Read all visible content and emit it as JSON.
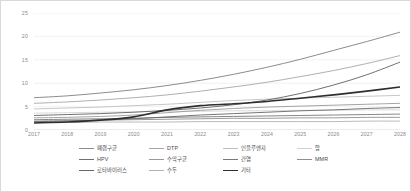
{
  "chart_data": {
    "type": "line",
    "title": "",
    "subtitle": "",
    "xlabel": "",
    "ylabel": "",
    "x": [
      2017,
      2018,
      2019,
      2020,
      2021,
      2022,
      2023,
      2024,
      2025,
      2026,
      2027,
      2028
    ],
    "xtick_labels": [
      "2017",
      "2018",
      "2019",
      "2020",
      "2021",
      "2022",
      "2023",
      "2024",
      "2025",
      "2026",
      "2027",
      "2028"
    ],
    "ytick_labels": [
      "0",
      "5",
      "10",
      "15",
      "20",
      "25"
    ],
    "yticks": [
      0,
      5,
      10,
      15,
      20,
      25
    ],
    "ylim": [
      0,
      25
    ],
    "xlim": [
      2017,
      2028
    ],
    "grid": "horizontal",
    "legend_position": "bottom",
    "legend_columns": 4,
    "series": [
      {
        "name": "폐렴구균",
        "color": "#8c8c8c",
        "width": 1.0,
        "values": [
          6.9,
          7.3,
          7.9,
          8.6,
          9.5,
          10.6,
          11.9,
          13.4,
          15.1,
          17.0,
          18.9,
          20.9
        ]
      },
      {
        "name": "DTP",
        "color": "#a6a6a6",
        "width": 0.9,
        "values": [
          5.7,
          6.0,
          6.4,
          6.9,
          7.5,
          8.3,
          9.2,
          10.2,
          11.4,
          12.7,
          14.2,
          15.9
        ]
      },
      {
        "name": "인플루엔자",
        "color": "#bfbfbf",
        "width": 0.9,
        "values": [
          4.5,
          4.7,
          4.9,
          5.2,
          5.5,
          5.9,
          6.3,
          6.6,
          6.8,
          7.0,
          7.2,
          7.4
        ]
      },
      {
        "name": "암",
        "color": "#d0d0d0",
        "width": 0.8,
        "values": [
          3.6,
          3.7,
          3.8,
          3.9,
          4.0,
          4.0,
          4.1,
          4.1,
          4.2,
          4.2,
          4.3,
          4.3
        ]
      },
      {
        "name": "HPV",
        "color": "#707070",
        "width": 1.0,
        "values": [
          3.1,
          3.3,
          3.5,
          3.8,
          4.2,
          4.7,
          5.4,
          6.4,
          7.8,
          9.6,
          11.8,
          14.5
        ]
      },
      {
        "name": "수막구균",
        "color": "#999999",
        "width": 0.9,
        "values": [
          2.6,
          2.7,
          2.9,
          3.2,
          3.7,
          4.2,
          4.6,
          4.9,
          5.1,
          5.3,
          5.5,
          5.7
        ]
      },
      {
        "name": "간염",
        "color": "#787878",
        "width": 0.9,
        "values": [
          2.2,
          2.3,
          2.4,
          2.5,
          2.7,
          2.8,
          2.9,
          3.0,
          3.1,
          3.2,
          3.3,
          3.4
        ]
      },
      {
        "name": "MMR",
        "color": "#8f8f8f",
        "width": 0.9,
        "values": [
          1.9,
          2.0,
          2.1,
          2.2,
          2.3,
          2.4,
          2.5,
          2.5,
          2.6,
          2.6,
          2.7,
          2.7
        ]
      },
      {
        "name": "로타바이러스",
        "color": "#666666",
        "width": 0.9,
        "values": [
          1.8,
          1.9,
          2.1,
          2.4,
          2.8,
          3.2,
          3.5,
          3.8,
          4.1,
          4.3,
          4.6,
          4.8
        ]
      },
      {
        "name": "수두",
        "color": "#b3b3b3",
        "width": 0.9,
        "values": [
          1.6,
          1.6,
          1.7,
          1.7,
          1.7,
          1.8,
          1.8,
          1.8,
          1.8,
          1.8,
          1.9,
          1.9
        ]
      },
      {
        "name": "기타",
        "color": "#2e2e2e",
        "width": 1.6,
        "values": [
          1.5,
          1.7,
          2.1,
          2.8,
          4.3,
          5.2,
          5.6,
          6.1,
          6.8,
          7.5,
          8.3,
          9.2
        ]
      }
    ]
  },
  "legend": {
    "items": [
      {
        "label": "폐렴구균",
        "color": "#8c8c8c",
        "width": 1.2
      },
      {
        "label": "DTP",
        "color": "#a6a6a6",
        "width": 1.1
      },
      {
        "label": "인플루엔자",
        "color": "#bfbfbf",
        "width": 1.1
      },
      {
        "label": "암",
        "color": "#d0d0d0",
        "width": 1.0
      },
      {
        "label": "HPV",
        "color": "#707070",
        "width": 1.2
      },
      {
        "label": "수막구균",
        "color": "#999999",
        "width": 1.1
      },
      {
        "label": "간염",
        "color": "#787878",
        "width": 1.1
      },
      {
        "label": "MMR",
        "color": "#8f8f8f",
        "width": 1.1
      },
      {
        "label": "로타바이러스",
        "color": "#666666",
        "width": 1.1
      },
      {
        "label": "수두",
        "color": "#b3b3b3",
        "width": 1.1
      },
      {
        "label": "기타",
        "color": "#2e2e2e",
        "width": 1.9
      }
    ]
  },
  "style": {
    "border_color": "#d9d9d9",
    "grid_color": "#e8e8e8",
    "axis_text_color": "#8a8a8a",
    "legend_text_color": "#4a4a4a",
    "background": "#ffffff"
  }
}
